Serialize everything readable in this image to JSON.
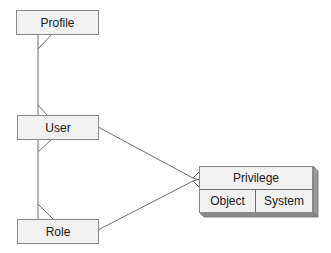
{
  "diagram": {
    "type": "entity-relationship",
    "entities": [
      {
        "id": "profile",
        "label": "Profile"
      },
      {
        "id": "user",
        "label": "User"
      },
      {
        "id": "role",
        "label": "Role"
      },
      {
        "id": "privilege",
        "label": "Privilege",
        "subtypes": [
          "Object",
          "System"
        ]
      }
    ],
    "relationships": [
      {
        "from": "profile",
        "to": "user",
        "cardinality": "one-to-many"
      },
      {
        "from": "user",
        "to": "role",
        "cardinality": "many-to-many"
      },
      {
        "from": "user",
        "to": "privilege",
        "cardinality": "one-to-many"
      },
      {
        "from": "role",
        "to": "privilege",
        "cardinality": "one-to-many"
      }
    ]
  },
  "labels": {
    "profile": "Profile",
    "user": "User",
    "role": "Role",
    "privilege": "Privilege",
    "object": "Object",
    "system": "System"
  },
  "colors": {
    "box_fill": "#f1f1f1",
    "box_stroke": "#8a8a8a",
    "line": "#6e6e6e",
    "shadow": "#8a8a8a"
  }
}
